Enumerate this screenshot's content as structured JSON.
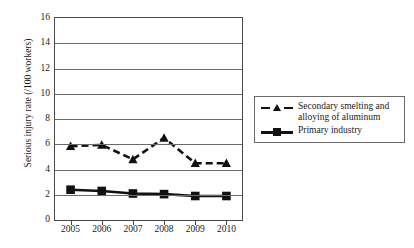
{
  "chart_data": {
    "type": "line",
    "title": "",
    "xlabel": "",
    "ylabel": "Serious injury rate (/100 workers)",
    "categories": [
      "2005",
      "2006",
      "2007",
      "2008",
      "2009",
      "2010"
    ],
    "x": [
      2005,
      2006,
      2007,
      2008,
      2009,
      2010
    ],
    "xlim": [
      2004.7,
      2010.3
    ],
    "ylim": [
      0,
      16
    ],
    "yticks": [
      0,
      2,
      4,
      6,
      8,
      10,
      12,
      14,
      16
    ],
    "ytick_labels": [
      "0",
      "2",
      "4",
      "6",
      "8",
      "10",
      "12",
      "14",
      "16"
    ],
    "grid": "horizontal",
    "legend_position": "right",
    "series": [
      {
        "name": "Secondary smelting and alloying of aluminum",
        "legend_label_line1": "Secondary smelting and",
        "legend_label_line2": "alloying of aluminum",
        "marker": "triangle",
        "linestyle": "dashed",
        "color": "#111111",
        "values": [
          5.85,
          5.95,
          4.8,
          6.5,
          4.5,
          4.5
        ]
      },
      {
        "name": "Primary industry",
        "legend_label_line1": "Primary industry",
        "legend_label_line2": "",
        "marker": "square",
        "linestyle": "solid",
        "color": "#111111",
        "values": [
          2.4,
          2.3,
          2.1,
          2.05,
          1.9,
          1.9
        ]
      }
    ]
  },
  "axes": {
    "y_title": "Serious injury rate (/100 workers)",
    "y_ticks": [
      "16",
      "14",
      "12",
      "10",
      "8",
      "6",
      "4",
      "2",
      "0"
    ],
    "x_ticks": [
      "2005",
      "2006",
      "2007",
      "2008",
      "2009",
      "2010"
    ]
  },
  "legend": {
    "items": [
      {
        "label_line1": "Secondary smelting and",
        "label_line2": "alloying of aluminum"
      },
      {
        "label_line1": "Primary industry",
        "label_line2": ""
      }
    ]
  }
}
